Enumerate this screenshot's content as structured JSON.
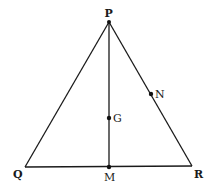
{
  "diagram": {
    "type": "triangle",
    "points": {
      "P": {
        "label": "P",
        "x": 109,
        "y": 22
      },
      "Q": {
        "label": "Q",
        "x": 25,
        "y": 167
      },
      "R": {
        "label": "R",
        "x": 192,
        "y": 166
      },
      "M": {
        "label": "M",
        "x": 109,
        "y": 167
      },
      "G": {
        "label": "G",
        "x": 109,
        "y": 118
      },
      "N": {
        "label": "N",
        "x": 151,
        "y": 94
      }
    },
    "segments": [
      "PQ",
      "PR",
      "QR",
      "PM"
    ],
    "colors": {
      "stroke": "#1a1a1a",
      "background": "#ffffff"
    }
  }
}
